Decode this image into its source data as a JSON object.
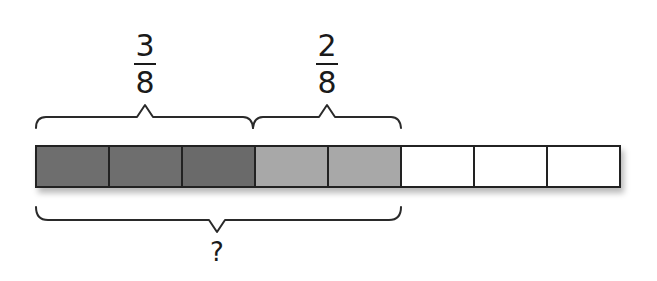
{
  "diagram": {
    "type": "fraction-strip",
    "total_parts": 8,
    "labels": {
      "first_fraction": {
        "numerator": "3",
        "denominator": "8"
      },
      "second_fraction": {
        "numerator": "2",
        "denominator": "8"
      },
      "sum_label": "?"
    },
    "cells": [
      {
        "index": 1,
        "fill": "dark",
        "color": "#6e6e6e"
      },
      {
        "index": 2,
        "fill": "dark",
        "color": "#6e6e6e"
      },
      {
        "index": 3,
        "fill": "dark",
        "color": "#6e6e6e"
      },
      {
        "index": 4,
        "fill": "light",
        "color": "#a8a8a8"
      },
      {
        "index": 5,
        "fill": "light",
        "color": "#a8a8a8"
      },
      {
        "index": 6,
        "fill": "empty",
        "color": "#ffffff"
      },
      {
        "index": 7,
        "fill": "empty",
        "color": "#ffffff"
      },
      {
        "index": 8,
        "fill": "empty",
        "color": "#ffffff"
      }
    ],
    "colors": {
      "dark_shade": "#6e6e6e",
      "light_shade": "#a8a8a8",
      "empty": "#ffffff",
      "outline": "#222222"
    }
  }
}
